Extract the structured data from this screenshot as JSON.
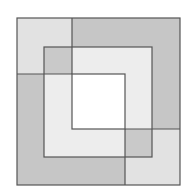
{
  "diagram": {
    "type": "nested-squares-pinwheel",
    "colors": {
      "background": "#ffffff",
      "stroke": "#555555",
      "light": "#e4e4e4",
      "medium": "#c9c9c9",
      "dark": "#bdbdbd",
      "lighter": "#efefef",
      "center": "#ffffff"
    },
    "outer_square": {
      "x": 17,
      "y": 18,
      "w": 163,
      "h": 167
    },
    "middle_square": {
      "x": 44,
      "y": 47,
      "w": 108,
      "h": 110
    },
    "inner_square": {
      "x": 72,
      "y": 74,
      "w": 53,
      "h": 55
    }
  }
}
